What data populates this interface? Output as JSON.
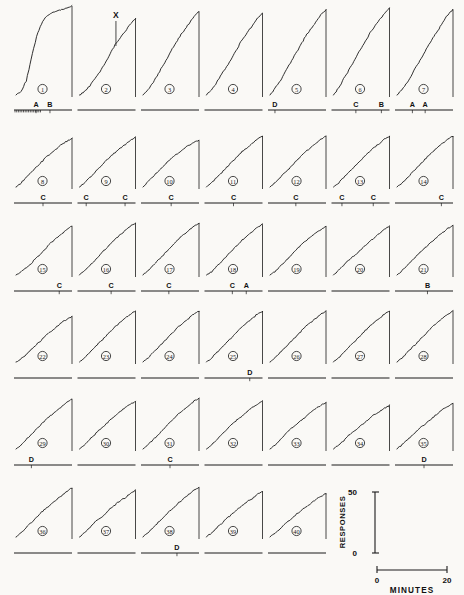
{
  "figure": {
    "background_color": "#faf9f6",
    "ink_color": "#1a1a1a",
    "rows": 6,
    "columns": 7,
    "panel_count": 40
  },
  "chart_data": {
    "type": "line",
    "xlabel": "MINUTES",
    "ylabel": "RESPONSES",
    "xlim": [
      0,
      20
    ],
    "ylim": [
      0,
      50
    ],
    "grid": false,
    "legend": "none",
    "scale_legend": {
      "y_axis_label": "RESPONSES",
      "y_tick_top": "50",
      "y_tick_bottom": "0",
      "x_axis_label": "MINUTES",
      "x_tick_left": "0",
      "x_tick_right": "20"
    },
    "annotations": [
      {
        "text": "X",
        "panel": 2,
        "note": "marker above record 2"
      }
    ],
    "series": [
      {
        "name": "1",
        "values": [
          0,
          2,
          8,
          20,
          33,
          40,
          44,
          46,
          47,
          48,
          49,
          50
        ]
      },
      {
        "name": "2",
        "values": [
          0,
          2,
          5,
          9,
          13,
          18,
          23,
          28,
          32,
          36,
          40,
          43
        ]
      },
      {
        "name": "3",
        "values": [
          0,
          3,
          7,
          12,
          17,
          22,
          27,
          32,
          36,
          40,
          44,
          47
        ]
      },
      {
        "name": "4",
        "values": [
          0,
          3,
          7,
          12,
          16,
          21,
          26,
          31,
          35,
          39,
          43,
          46
        ]
      },
      {
        "name": "5",
        "values": [
          0,
          4,
          8,
          13,
          18,
          23,
          28,
          33,
          37,
          41,
          45,
          48
        ]
      },
      {
        "name": "6",
        "values": [
          0,
          4,
          9,
          14,
          19,
          24,
          29,
          34,
          38,
          42,
          46,
          49
        ]
      },
      {
        "name": "7",
        "values": [
          0,
          3,
          7,
          12,
          17,
          22,
          27,
          32,
          36,
          41,
          45,
          48
        ]
      },
      {
        "name": "8",
        "values": [
          0,
          4,
          9,
          14,
          19,
          24,
          29,
          33,
          37,
          41,
          44,
          47
        ]
      },
      {
        "name": "9",
        "values": [
          0,
          4,
          9,
          14,
          19,
          24,
          29,
          33,
          37,
          41,
          45,
          48
        ]
      },
      {
        "name": "10",
        "values": [
          0,
          5,
          10,
          15,
          20,
          25,
          29,
          33,
          37,
          40,
          43,
          45
        ]
      },
      {
        "name": "11",
        "values": [
          0,
          4,
          9,
          14,
          19,
          24,
          29,
          34,
          38,
          42,
          46,
          49
        ]
      },
      {
        "name": "12",
        "values": [
          0,
          4,
          9,
          14,
          19,
          24,
          29,
          34,
          38,
          42,
          46,
          49
        ]
      },
      {
        "name": "13",
        "values": [
          0,
          4,
          9,
          14,
          19,
          24,
          29,
          34,
          38,
          42,
          46,
          49
        ]
      },
      {
        "name": "14",
        "values": [
          0,
          4,
          9,
          14,
          19,
          24,
          29,
          34,
          38,
          42,
          46,
          49
        ]
      },
      {
        "name": "15",
        "values": [
          0,
          3,
          7,
          11,
          16,
          21,
          26,
          31,
          35,
          39,
          43,
          46
        ]
      },
      {
        "name": "16",
        "values": [
          0,
          4,
          9,
          14,
          19,
          24,
          29,
          34,
          38,
          42,
          46,
          49
        ]
      },
      {
        "name": "17",
        "values": [
          0,
          4,
          9,
          14,
          19,
          24,
          29,
          34,
          38,
          42,
          46,
          49
        ]
      },
      {
        "name": "18",
        "values": [
          0,
          3,
          8,
          13,
          18,
          23,
          28,
          33,
          37,
          41,
          45,
          48
        ]
      },
      {
        "name": "19",
        "values": [
          0,
          3,
          8,
          13,
          18,
          23,
          28,
          32,
          36,
          40,
          43,
          46
        ]
      },
      {
        "name": "20",
        "values": [
          0,
          4,
          9,
          14,
          18,
          22,
          27,
          31,
          35,
          39,
          43,
          46
        ]
      },
      {
        "name": "21",
        "values": [
          0,
          4,
          9,
          14,
          19,
          23,
          28,
          32,
          36,
          40,
          44,
          47
        ]
      },
      {
        "name": "22",
        "values": [
          0,
          3,
          7,
          12,
          17,
          21,
          26,
          30,
          34,
          38,
          41,
          44
        ]
      },
      {
        "name": "23",
        "values": [
          0,
          4,
          9,
          14,
          19,
          24,
          29,
          34,
          38,
          42,
          46,
          49
        ]
      },
      {
        "name": "24",
        "values": [
          0,
          4,
          9,
          14,
          19,
          24,
          29,
          34,
          38,
          42,
          46,
          49
        ]
      },
      {
        "name": "25",
        "values": [
          0,
          4,
          9,
          14,
          19,
          24,
          29,
          34,
          38,
          42,
          46,
          49
        ]
      },
      {
        "name": "26",
        "values": [
          0,
          4,
          9,
          14,
          19,
          24,
          29,
          34,
          38,
          42,
          46,
          49
        ]
      },
      {
        "name": "27",
        "values": [
          0,
          4,
          9,
          14,
          19,
          24,
          29,
          34,
          38,
          42,
          46,
          49
        ]
      },
      {
        "name": "28",
        "values": [
          0,
          4,
          9,
          14,
          19,
          24,
          29,
          34,
          38,
          42,
          46,
          49
        ]
      },
      {
        "name": "29",
        "values": [
          0,
          4,
          9,
          14,
          19,
          24,
          29,
          33,
          37,
          41,
          45,
          48
        ]
      },
      {
        "name": "30",
        "values": [
          0,
          4,
          9,
          14,
          19,
          23,
          28,
          32,
          36,
          40,
          43,
          46
        ]
      },
      {
        "name": "31",
        "values": [
          0,
          4,
          9,
          14,
          19,
          24,
          29,
          34,
          38,
          42,
          46,
          49
        ]
      },
      {
        "name": "32",
        "values": [
          0,
          4,
          9,
          14,
          19,
          24,
          28,
          32,
          36,
          40,
          43,
          46
        ]
      },
      {
        "name": "33",
        "values": [
          0,
          4,
          9,
          14,
          19,
          23,
          27,
          31,
          35,
          39,
          42,
          45
        ]
      },
      {
        "name": "34",
        "values": [
          0,
          4,
          8,
          13,
          17,
          21,
          25,
          29,
          33,
          36,
          39,
          42
        ]
      },
      {
        "name": "35",
        "values": [
          0,
          4,
          9,
          13,
          18,
          22,
          26,
          30,
          34,
          38,
          41,
          44
        ]
      },
      {
        "name": "36",
        "values": [
          0,
          4,
          9,
          14,
          19,
          24,
          28,
          32,
          36,
          40,
          44,
          47
        ]
      },
      {
        "name": "37",
        "values": [
          0,
          4,
          9,
          14,
          18,
          22,
          27,
          31,
          35,
          38,
          42,
          45
        ]
      },
      {
        "name": "38",
        "values": [
          0,
          4,
          9,
          14,
          19,
          24,
          28,
          33,
          37,
          41,
          45,
          48
        ]
      },
      {
        "name": "39",
        "values": [
          0,
          4,
          9,
          13,
          18,
          22,
          26,
          30,
          34,
          37,
          41,
          44
        ]
      },
      {
        "name": "40",
        "values": [
          0,
          4,
          8,
          13,
          17,
          21,
          25,
          29,
          32,
          36,
          39,
          42
        ]
      }
    ]
  },
  "panel_labels": [
    "1",
    "2",
    "3",
    "4",
    "5",
    "6",
    "7",
    "8",
    "9",
    "10",
    "11",
    "12",
    "13",
    "14",
    "15",
    "16",
    "17",
    "18",
    "19",
    "20",
    "21",
    "22",
    "23",
    "24",
    "25",
    "26",
    "27",
    "28",
    "29",
    "30",
    "31",
    "32",
    "33",
    "34",
    "35",
    "36",
    "37",
    "38",
    "39",
    "40"
  ],
  "event_labels": {
    "row1": [
      {
        "panel": 1,
        "text": "A",
        "pos": 0.38
      },
      {
        "panel": 1,
        "text": "B",
        "pos": 0.62
      },
      {
        "panel": 5,
        "text": "D",
        "pos": 0.12
      },
      {
        "panel": 6,
        "text": "C",
        "pos": 0.42
      },
      {
        "panel": 6,
        "text": "B",
        "pos": 0.86
      },
      {
        "panel": 7,
        "text": "A",
        "pos": 0.3
      },
      {
        "panel": 7,
        "text": "A",
        "pos": 0.52
      }
    ],
    "row2": [
      {
        "panel": 8,
        "text": "C",
        "pos": 0.5
      },
      {
        "panel": 9,
        "text": "C",
        "pos": 0.15
      },
      {
        "panel": 9,
        "text": "C",
        "pos": 0.82
      },
      {
        "panel": 10,
        "text": "C",
        "pos": 0.52
      },
      {
        "panel": 11,
        "text": "C",
        "pos": 0.5
      },
      {
        "panel": 12,
        "text": "C",
        "pos": 0.48
      },
      {
        "panel": 13,
        "text": "C",
        "pos": 0.18
      },
      {
        "panel": 13,
        "text": "C",
        "pos": 0.72
      },
      {
        "panel": 14,
        "text": "C",
        "pos": 0.8
      }
    ],
    "row3": [
      {
        "panel": 15,
        "text": "C",
        "pos": 0.78
      },
      {
        "panel": 16,
        "text": "C",
        "pos": 0.58
      },
      {
        "panel": 17,
        "text": "C",
        "pos": 0.48
      },
      {
        "panel": 18,
        "text": "C",
        "pos": 0.48
      },
      {
        "panel": 18,
        "text": "A",
        "pos": 0.72
      },
      {
        "panel": 21,
        "text": "B",
        "pos": 0.56
      }
    ],
    "row4": [
      {
        "panel": 25,
        "text": "D",
        "pos": 0.78
      }
    ],
    "row5": [
      {
        "panel": 29,
        "text": "D",
        "pos": 0.3
      },
      {
        "panel": 31,
        "text": "C",
        "pos": 0.5
      },
      {
        "panel": 35,
        "text": "D",
        "pos": 0.5
      }
    ],
    "row6": [
      {
        "panel": 38,
        "text": "D",
        "pos": 0.62
      }
    ]
  },
  "legend_axes": {
    "y_top": "50",
    "y_bottom": "0",
    "y_title": "RESPONSES",
    "x_left": "0",
    "x_right": "20",
    "x_title": "MINUTES"
  },
  "marker_x": "X"
}
